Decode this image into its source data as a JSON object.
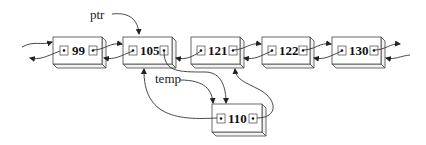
{
  "diagram": {
    "type": "doubly-linked-list-insertion",
    "labels": {
      "ptr": "ptr",
      "temp": "temp"
    },
    "list_nodes": [
      {
        "id": "n99",
        "value": "99"
      },
      {
        "id": "n105",
        "value": "105"
      },
      {
        "id": "n121",
        "value": "121"
      },
      {
        "id": "n122",
        "value": "122"
      },
      {
        "id": "n130",
        "value": "130"
      }
    ],
    "new_node": {
      "id": "n110",
      "value": "110"
    },
    "pointers": [
      {
        "from": "ptr",
        "to": "n105"
      },
      {
        "from": "temp",
        "to": "n110"
      },
      {
        "from": "n105.next",
        "to": "n110"
      },
      {
        "from": "n110.prev",
        "to": "n105"
      },
      {
        "from": "n110.next",
        "to": "n121"
      }
    ],
    "colors": {
      "stroke": "#333333",
      "background": "#ffffff"
    }
  }
}
